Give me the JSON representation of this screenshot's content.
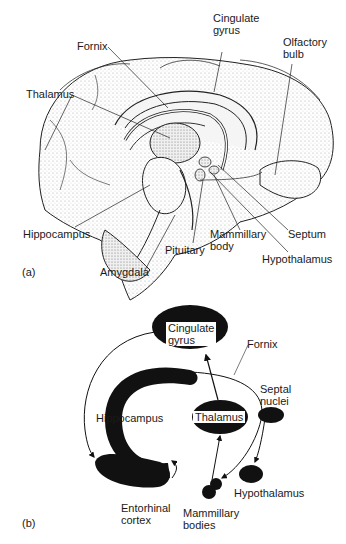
{
  "panel_a": {
    "tag": "(a)",
    "labels": {
      "cingulate_gyrus_1": "Cingulate",
      "cingulate_gyrus_2": "gyrus",
      "olfactory_bulb_1": "Olfactory",
      "olfactory_bulb_2": "bulb",
      "fornix": "Fornix",
      "thalamus": "Thalamus",
      "hippocampus": "Hippocampus",
      "pituitary": "Pituitary",
      "mammillary_body_1": "Mammillary",
      "mammillary_body_2": "body",
      "septum": "Septum",
      "hypothalamus": "Hypothalamus",
      "amygdala": "Amygdala"
    }
  },
  "panel_b": {
    "tag": "(b)",
    "labels": {
      "cingulate_gyrus_1": "Cingulate",
      "cingulate_gyrus_2": "gyrus",
      "fornix": "Fornix",
      "septal_nuclei_1": "Septal",
      "septal_nuclei_2": "nuclei",
      "hippocampus": "Hippocampus",
      "thalamus": "Thalamus",
      "hypothalamus": "Hypothalamus",
      "entorhinal_cortex_1": "Entorhinal",
      "entorhinal_cortex_2": "cortex",
      "mammillary_bodies_1": "Mammillary",
      "mammillary_bodies_2": "bodies"
    }
  }
}
